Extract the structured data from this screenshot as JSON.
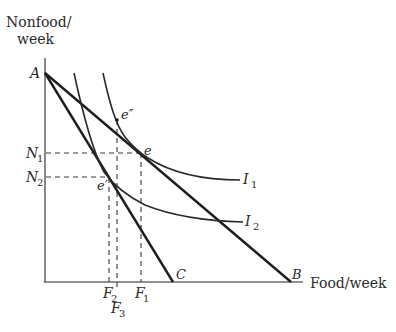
{
  "diagram": {
    "type": "indifference-curve-budget-constraint",
    "axes": {
      "y_label_line1": "Nonfood/",
      "y_label_line2": "week",
      "x_label": "Food/week"
    },
    "points": {
      "A": "A",
      "B": "B",
      "C": "C",
      "e": "e",
      "e_prime": "e′",
      "e_double_prime": "e″"
    },
    "budget_lines": [
      {
        "name": "AB",
        "from": "A",
        "to": "B"
      },
      {
        "name": "AC",
        "from": "A",
        "to": "C"
      }
    ],
    "indifference_curves": [
      {
        "name": "I1",
        "label": "I",
        "subscript": "1"
      },
      {
        "name": "I2",
        "label": "I",
        "subscript": "2"
      }
    ],
    "y_ticks": [
      {
        "label": "N",
        "subscript": "1"
      },
      {
        "label": "N",
        "subscript": "2"
      }
    ],
    "x_ticks": [
      {
        "label": "F",
        "subscript": "2"
      },
      {
        "label": "F",
        "subscript": "3"
      },
      {
        "label": "F",
        "subscript": "1"
      }
    ]
  }
}
